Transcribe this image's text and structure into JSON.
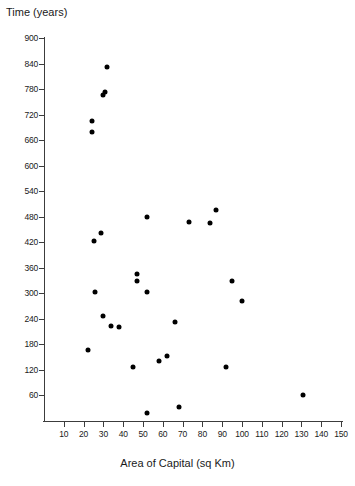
{
  "chart_data": {
    "type": "scatter",
    "title": "Time (years)",
    "xlabel": "Area of Capital (sq Km)",
    "ylabel": "Time (years)",
    "xlim": [
      0,
      150
    ],
    "ylim": [
      0,
      900
    ],
    "grid": false,
    "legend": "none",
    "marker": "filled-circle",
    "marker_color": "#000000",
    "xticks": [
      10,
      20,
      30,
      40,
      50,
      60,
      70,
      80,
      90,
      100,
      110,
      120,
      130,
      140,
      150
    ],
    "yticks": [
      60,
      120,
      180,
      240,
      300,
      360,
      420,
      480,
      540,
      600,
      660,
      720,
      780,
      840,
      900
    ],
    "points": [
      {
        "x": 32,
        "y": 832
      },
      {
        "x": 31,
        "y": 774
      },
      {
        "x": 30,
        "y": 766
      },
      {
        "x": 24,
        "y": 706
      },
      {
        "x": 24,
        "y": 678
      },
      {
        "x": 87,
        "y": 495
      },
      {
        "x": 52,
        "y": 480
      },
      {
        "x": 73,
        "y": 468
      },
      {
        "x": 84,
        "y": 466
      },
      {
        "x": 29,
        "y": 442
      },
      {
        "x": 25,
        "y": 424
      },
      {
        "x": 95,
        "y": 330
      },
      {
        "x": 47,
        "y": 346
      },
      {
        "x": 47,
        "y": 330
      },
      {
        "x": 26,
        "y": 302
      },
      {
        "x": 52,
        "y": 302
      },
      {
        "x": 100,
        "y": 283
      },
      {
        "x": 30,
        "y": 247
      },
      {
        "x": 66,
        "y": 232
      },
      {
        "x": 34,
        "y": 224
      },
      {
        "x": 38,
        "y": 221
      },
      {
        "x": 22,
        "y": 166
      },
      {
        "x": 62,
        "y": 152
      },
      {
        "x": 58,
        "y": 141
      },
      {
        "x": 45,
        "y": 128
      },
      {
        "x": 92,
        "y": 128
      },
      {
        "x": 131,
        "y": 60
      },
      {
        "x": 68,
        "y": 32
      },
      {
        "x": 52,
        "y": 18
      }
    ]
  }
}
